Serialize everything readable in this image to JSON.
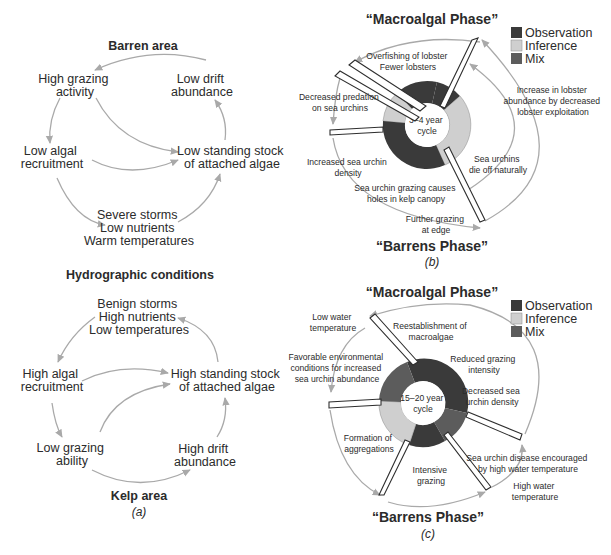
{
  "panel_a": {
    "caption": "(a)",
    "barren": {
      "heading": "Barren area",
      "high_grazing": [
        "High grazing",
        "activity"
      ],
      "low_drift": [
        "Low drift",
        "abundance"
      ],
      "low_algal": [
        "Low algal",
        "recruitment"
      ],
      "low_stock": [
        "Low standing stock",
        "of attached algae"
      ],
      "conditions": [
        "Severe storms",
        "Low nutrients",
        "Warm temperatures"
      ]
    },
    "middle_heading": "Hydrographic conditions",
    "kelp": {
      "conditions": [
        "Benign storms",
        "High nutrients",
        "Low temperatures"
      ],
      "high_algal": [
        "High algal",
        "recruitment"
      ],
      "high_stock": [
        "High standing stock",
        "of attached algae"
      ],
      "low_grazing": [
        "Low grazing",
        "ability"
      ],
      "high_drift": [
        "High drift",
        "abundance"
      ],
      "heading": "Kelp area"
    }
  },
  "panel_b": {
    "caption": "(b)",
    "top_phase": "“Macroalgal Phase”",
    "bottom_phase": "“Barrens Phase”",
    "center": [
      "3–4 year",
      "cycle"
    ],
    "labels": {
      "overfishing": [
        "Overfishing of lobster",
        "Fewer lobsters"
      ],
      "decreased_predation": [
        "Decreased predation",
        "on sea urchins"
      ],
      "increased_density": [
        "Increased sea urchin",
        "density"
      ],
      "grazing_holes": [
        "Sea urchin grazing causes",
        "holes in kelp canopy"
      ],
      "further_grazing": [
        "Further grazing",
        "at edge"
      ],
      "die_off": [
        "Sea urchins",
        "die off naturally"
      ],
      "lobster_increase": [
        "Increase in lobster",
        "abundance by decreased",
        "lobster exploitation"
      ]
    }
  },
  "panel_c": {
    "caption": "(c)",
    "top_phase": "“Macroalgal Phase”",
    "bottom_phase": "“Barrens Phase”",
    "center": [
      "15–20 year",
      "cycle"
    ],
    "labels": {
      "low_water_temp": [
        "Low water",
        "temperature"
      ],
      "favorable": [
        "Favorable environmental",
        "conditions for increased",
        "sea urchin abundance"
      ],
      "reestablishment": [
        "Reestablishment of",
        "macroalgae"
      ],
      "reduced_grazing": [
        "Reduced grazing",
        "intensity"
      ],
      "decreased_density": [
        "Decreased sea",
        "urchin density"
      ],
      "aggregations": [
        "Formation of",
        "aggregations"
      ],
      "intensive": [
        "Intensive",
        "grazing"
      ],
      "disease": [
        "Sea urchin disease encouraged",
        "by high water temperature"
      ],
      "high_water_temp": [
        "High water",
        "temperature"
      ]
    }
  },
  "legend": {
    "items": [
      {
        "label": "Observation",
        "color": "#3a3a3a"
      },
      {
        "label": "Inference",
        "color": "#cfcfcf"
      },
      {
        "label": "Mix",
        "color": "#5c5c5c"
      }
    ]
  },
  "colors": {
    "arrow": "#a9a9a9",
    "observation": "#3a3a3a",
    "inference": "#cfcfcf",
    "mix": "#5c5c5c"
  }
}
